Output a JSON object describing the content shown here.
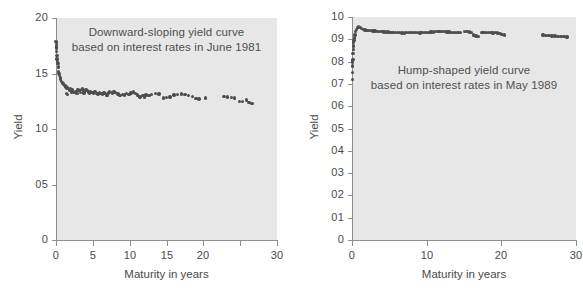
{
  "figure": {
    "background_color": "#ffffff",
    "plot_fill_color": "#e7e7e7",
    "axis_color": "#8e8e8e",
    "marker_color": "#4d4d4d"
  },
  "chart_data": [
    {
      "type": "scatter",
      "panel": "left",
      "title": "",
      "annotation": "Downward-sloping yield curve\nbased on interest rates in June 1981",
      "annotation_lines": [
        "Downward-sloping yield curve",
        "based on interest rates in June 1981"
      ],
      "xlabel": "Maturity in years",
      "ylabel": "Yield",
      "xlim": [
        0,
        30
      ],
      "ylim": [
        0,
        20
      ],
      "xticks": [
        0,
        5,
        10,
        15,
        20,
        25,
        30
      ],
      "xticklabels": [
        "0",
        "5",
        "10",
        "15",
        "20",
        "",
        "30"
      ],
      "yticks": [
        0,
        5,
        10,
        15,
        20
      ],
      "yticklabels": [
        "0",
        "05",
        "10",
        "15",
        "20"
      ],
      "grid": false,
      "legend": "none",
      "marker": "filled-circle",
      "points": [
        [
          0.05,
          17.6
        ],
        [
          0.08,
          17.8
        ],
        [
          0.1,
          17.3
        ],
        [
          0.12,
          16.6
        ],
        [
          0.15,
          16.3
        ],
        [
          0.2,
          16.1
        ],
        [
          0.25,
          15.9
        ],
        [
          0.3,
          15.6
        ],
        [
          0.35,
          15.2
        ],
        [
          0.42,
          15.0
        ],
        [
          0.5,
          14.8
        ],
        [
          0.58,
          14.6
        ],
        [
          0.65,
          14.5
        ],
        [
          0.75,
          14.3
        ],
        [
          0.85,
          14.2
        ],
        [
          0.95,
          14.1
        ],
        [
          1.05,
          14.0
        ],
        [
          1.2,
          13.9
        ],
        [
          1.35,
          13.8
        ],
        [
          1.5,
          13.7
        ],
        [
          1.7,
          13.65
        ],
        [
          1.85,
          13.5
        ],
        [
          2.0,
          13.6
        ],
        [
          2.2,
          13.5
        ],
        [
          2.35,
          13.3
        ],
        [
          2.5,
          13.3
        ],
        [
          2.7,
          13.4
        ],
        [
          2.85,
          13.2
        ],
        [
          3.0,
          13.5
        ],
        [
          3.15,
          13.45
        ],
        [
          3.3,
          13.3
        ],
        [
          3.45,
          13.55
        ],
        [
          3.6,
          13.6
        ],
        [
          3.75,
          13.4
        ],
        [
          3.9,
          13.3
        ],
        [
          4.05,
          13.5
        ],
        [
          4.2,
          13.45
        ],
        [
          4.4,
          13.35
        ],
        [
          4.55,
          13.2
        ],
        [
          4.7,
          13.4
        ],
        [
          4.9,
          13.3
        ],
        [
          5.1,
          13.25
        ],
        [
          5.3,
          13.4
        ],
        [
          5.5,
          13.2
        ],
        [
          5.7,
          13.15
        ],
        [
          5.9,
          13.3
        ],
        [
          6.1,
          13.2
        ],
        [
          6.3,
          13.1
        ],
        [
          6.5,
          13.25
        ],
        [
          6.7,
          13.2
        ],
        [
          6.9,
          13.0
        ],
        [
          7.1,
          13.25
        ],
        [
          7.3,
          13.4
        ],
        [
          7.5,
          13.3
        ],
        [
          7.7,
          13.2
        ],
        [
          7.9,
          13.35
        ],
        [
          8.1,
          13.3
        ],
        [
          8.4,
          13.15
        ],
        [
          8.7,
          13.0
        ],
        [
          9.0,
          13.1
        ],
        [
          9.3,
          13.05
        ],
        [
          9.6,
          13.2
        ],
        [
          9.9,
          13.1
        ],
        [
          10.2,
          13.25
        ],
        [
          10.5,
          13.35
        ],
        [
          10.8,
          13.2
        ],
        [
          11.1,
          13.05
        ],
        [
          11.4,
          12.9
        ],
        [
          11.8,
          13.0
        ],
        [
          12.2,
          13.05
        ],
        [
          12.6,
          13.0
        ],
        [
          13.0,
          13.1
        ],
        [
          13.5,
          13.2
        ],
        [
          14.0,
          13.15
        ],
        [
          1.4,
          13.2
        ],
        [
          1.6,
          13.1
        ],
        [
          14.6,
          12.8
        ],
        [
          15.0,
          12.85
        ],
        [
          15.5,
          12.9
        ],
        [
          16.0,
          13.05
        ],
        [
          16.5,
          13.1
        ],
        [
          17.0,
          13.15
        ],
        [
          17.5,
          13.1
        ],
        [
          18.0,
          13.0
        ],
        [
          18.5,
          12.95
        ],
        [
          19.0,
          12.75
        ],
        [
          19.4,
          12.7
        ],
        [
          20.3,
          12.8
        ],
        [
          22.8,
          12.95
        ],
        [
          23.3,
          12.9
        ],
        [
          23.8,
          12.85
        ],
        [
          24.2,
          12.8
        ],
        [
          24.9,
          12.5
        ],
        [
          25.3,
          12.45
        ],
        [
          25.9,
          12.6
        ],
        [
          26.2,
          12.4
        ],
        [
          26.6,
          12.3
        ],
        [
          0.02,
          17.9
        ],
        [
          0.03,
          17.4
        ],
        [
          0.06,
          17.0
        ],
        [
          12.0,
          12.9
        ],
        [
          2.1,
          13.35
        ],
        [
          3.8,
          13.25
        ]
      ]
    },
    {
      "type": "scatter",
      "panel": "right",
      "title": "",
      "annotation": "Hump-shaped yield curve\nbased on interest rates in May 1989",
      "annotation_lines": [
        "Hump-shaped yield curve",
        "based on interest rates in May 1989"
      ],
      "xlabel": "Maturity in years",
      "ylabel": "Yield",
      "xlim": [
        0,
        30
      ],
      "ylim": [
        0,
        10
      ],
      "xticks": [
        0,
        10,
        20,
        30
      ],
      "xticklabels": [
        "0",
        "10",
        "20",
        "30"
      ],
      "yticks": [
        0,
        1,
        2,
        3,
        4,
        5,
        6,
        7,
        8,
        9,
        10
      ],
      "yticklabels": [
        "0",
        "01",
        "02",
        "03",
        "04",
        "05",
        "06",
        "07",
        "08",
        "09",
        "10"
      ],
      "grid": false,
      "legend": "none",
      "marker": "filled-circle",
      "points": [
        [
          0.04,
          7.5
        ],
        [
          0.06,
          7.95
        ],
        [
          0.08,
          8.0
        ],
        [
          0.1,
          8.05
        ],
        [
          0.13,
          8.1
        ],
        [
          0.16,
          8.35
        ],
        [
          0.18,
          8.55
        ],
        [
          0.21,
          8.7
        ],
        [
          0.24,
          8.85
        ],
        [
          0.28,
          8.95
        ],
        [
          0.33,
          9.05
        ],
        [
          0.4,
          9.2
        ],
        [
          0.5,
          9.35
        ],
        [
          0.62,
          9.45
        ],
        [
          0.75,
          9.52
        ],
        [
          0.9,
          9.55
        ],
        [
          1.1,
          9.52
        ],
        [
          1.3,
          9.48
        ],
        [
          1.5,
          9.45
        ],
        [
          1.75,
          9.42
        ],
        [
          2.0,
          9.4
        ],
        [
          2.25,
          9.4
        ],
        [
          2.5,
          9.4
        ],
        [
          2.8,
          9.38
        ],
        [
          3.1,
          9.38
        ],
        [
          3.4,
          9.36
        ],
        [
          3.7,
          9.35
        ],
        [
          4.0,
          9.35
        ],
        [
          4.3,
          9.33
        ],
        [
          4.6,
          9.32
        ],
        [
          4.9,
          9.32
        ],
        [
          5.2,
          9.3
        ],
        [
          5.5,
          9.3
        ],
        [
          5.8,
          9.3
        ],
        [
          6.1,
          9.3
        ],
        [
          6.4,
          9.3
        ],
        [
          6.7,
          9.28
        ],
        [
          7.0,
          9.28
        ],
        [
          7.3,
          9.3
        ],
        [
          7.6,
          9.3
        ],
        [
          7.9,
          9.3
        ],
        [
          8.2,
          9.3
        ],
        [
          8.5,
          9.3
        ],
        [
          8.8,
          9.3
        ],
        [
          9.1,
          9.28
        ],
        [
          9.4,
          9.3
        ],
        [
          9.7,
          9.3
        ],
        [
          10.0,
          9.3
        ],
        [
          10.3,
          9.3
        ],
        [
          10.6,
          9.32
        ],
        [
          10.9,
          9.33
        ],
        [
          11.2,
          9.35
        ],
        [
          11.5,
          9.35
        ],
        [
          11.8,
          9.35
        ],
        [
          12.1,
          9.35
        ],
        [
          12.4,
          9.34
        ],
        [
          12.7,
          9.33
        ],
        [
          13.0,
          9.32
        ],
        [
          13.3,
          9.3
        ],
        [
          13.6,
          9.3
        ],
        [
          13.9,
          9.3
        ],
        [
          14.2,
          9.3
        ],
        [
          15.4,
          9.35
        ],
        [
          15.7,
          9.33
        ],
        [
          16.0,
          9.3
        ],
        [
          16.3,
          9.2
        ],
        [
          16.6,
          9.15
        ],
        [
          16.9,
          9.13
        ],
        [
          17.4,
          9.3
        ],
        [
          17.7,
          9.3
        ],
        [
          18.0,
          9.3
        ],
        [
          18.3,
          9.3
        ],
        [
          18.6,
          9.3
        ],
        [
          18.9,
          9.28
        ],
        [
          19.2,
          9.3
        ],
        [
          19.5,
          9.28
        ],
        [
          19.8,
          9.25
        ],
        [
          20.1,
          9.22
        ],
        [
          20.4,
          9.2
        ],
        [
          25.6,
          9.2
        ],
        [
          26.0,
          9.18
        ],
        [
          26.4,
          9.17
        ],
        [
          26.8,
          9.15
        ],
        [
          27.2,
          9.15
        ],
        [
          27.6,
          9.13
        ],
        [
          28.0,
          9.12
        ],
        [
          28.4,
          9.12
        ],
        [
          28.8,
          9.1
        ],
        [
          0.03,
          7.2
        ],
        [
          0.05,
          7.8
        ],
        [
          14.5,
          9.3
        ],
        [
          15.1,
          9.36
        ]
      ]
    }
  ]
}
